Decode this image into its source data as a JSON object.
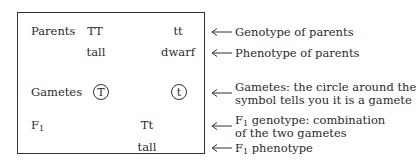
{
  "box": {
    "rows": {
      "parents": {
        "label": "Parents",
        "genotype_1": "TT",
        "genotype_2": "tt"
      },
      "phenotypes": {
        "phenotype_1": "tall",
        "phenotype_2": "dwarf"
      },
      "gametes": {
        "label": "Gametes",
        "gamete_1": "T",
        "gamete_2": "t"
      },
      "f1": {
        "label": "F",
        "label_sub": "1",
        "genotype": "Tt"
      },
      "f1_phenotype": {
        "phenotype": "tall"
      }
    }
  },
  "annotations": [
    {
      "text": "Genotype of parents"
    },
    {
      "text": "Phenotype of parents"
    },
    {
      "line1": "Gametes: the circle around the",
      "line2": "symbol tells you it is a gamete"
    },
    {
      "line1_prefix": "F",
      "line1_sub": "1",
      "line1_rest": " genotype: combination",
      "line2": "of the two gametes"
    },
    {
      "prefix": "F",
      "sub": "1",
      "rest": " phenotype"
    }
  ],
  "colors": {
    "text": "#2b2b2b",
    "border": "#333333",
    "background": "#ffffff"
  }
}
